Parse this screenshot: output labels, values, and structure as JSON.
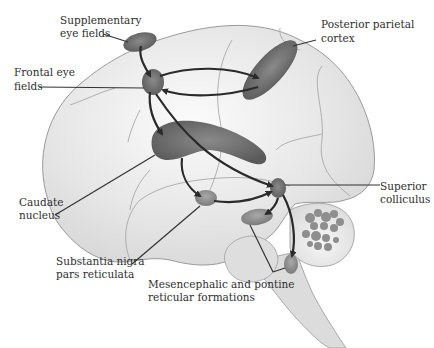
{
  "figure": {
    "type": "anatomical-diagram"
  },
  "labels": {
    "supplementary_eye_fields": [
      "Supplementary",
      "eye fields"
    ],
    "frontal_eye_fields": [
      "Frontal eye",
      "fields"
    ],
    "posterior_parietal_cortex": [
      "Posterior parietal",
      "cortex"
    ],
    "caudate_nucleus": [
      "Caudate",
      "nucleus"
    ],
    "superior_colliculus": [
      "Superior",
      "colliculus"
    ],
    "substantia_nigra": [
      "Substantia nigra",
      "pars reticulata"
    ],
    "reticular_formations": [
      "Mesencephalic and pontine",
      "reticular formations"
    ]
  },
  "structures": [
    {
      "id": "supplementary_eye_fields",
      "shape": "ellipse"
    },
    {
      "id": "frontal_eye_fields",
      "shape": "blob"
    },
    {
      "id": "posterior_parietal_cortex",
      "shape": "ellipse"
    },
    {
      "id": "caudate_nucleus",
      "shape": "curved-body"
    },
    {
      "id": "superior_colliculus",
      "shape": "blob"
    },
    {
      "id": "substantia_nigra",
      "shape": "ellipse"
    },
    {
      "id": "mesencephalic_reticular_formation",
      "shape": "ellipse"
    },
    {
      "id": "pontine_reticular_formation",
      "shape": "ellipse"
    }
  ],
  "connections": [
    {
      "from": "supplementary_eye_fields",
      "to": "frontal_eye_fields"
    },
    {
      "from": "frontal_eye_fields",
      "to": "posterior_parietal_cortex"
    },
    {
      "from": "posterior_parietal_cortex",
      "to": "frontal_eye_fields"
    },
    {
      "from": "frontal_eye_fields",
      "to": "caudate_nucleus"
    },
    {
      "from": "frontal_eye_fields",
      "to": "superior_colliculus"
    },
    {
      "from": "caudate_nucleus",
      "to": "substantia_nigra"
    },
    {
      "from": "substantia_nigra",
      "to": "superior_colliculus"
    },
    {
      "from": "superior_colliculus",
      "to": "mesencephalic_reticular_formation"
    },
    {
      "from": "superior_colliculus",
      "to": "pontine_reticular_formation"
    }
  ],
  "colors": {
    "brain_fill": "#e4e4e4",
    "structure_fill": "#6e6e6e",
    "arrow": "#2a2a2a",
    "text": "#2e2e2e"
  }
}
